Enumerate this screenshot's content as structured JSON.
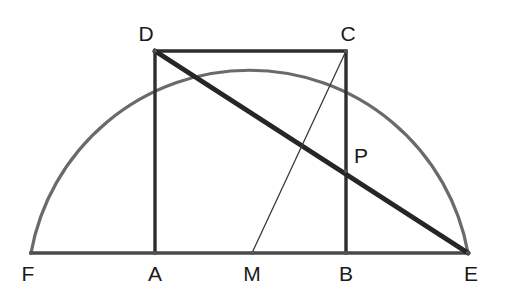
{
  "figure": {
    "width": 509,
    "height": 296,
    "background_color": "#ffffff"
  },
  "colors": {
    "arc": "#6a6a6a",
    "baseline": "#4a4a4a",
    "thin_line": "#3a3a3a",
    "thick_line": "#262626",
    "square_side": "#2e2e2e",
    "label": "#1a1a1a",
    "vertex_dot": "#555555"
  },
  "geometry": {
    "baseline_y": 253,
    "circle": {
      "center_x": 252,
      "center_y": 253,
      "radius": 222
    }
  },
  "points": [
    {
      "id": "F",
      "label": "F",
      "x": 31,
      "y": 253,
      "label_x": 28,
      "label_y": 281,
      "label_anchor": "middle",
      "role": "semicircle-left-end"
    },
    {
      "id": "A",
      "label": "A",
      "x": 155,
      "y": 253,
      "label_x": 155,
      "label_y": 281,
      "label_anchor": "middle",
      "role": "rectangle-bottom-left"
    },
    {
      "id": "M",
      "label": "M",
      "x": 252,
      "y": 253,
      "label_x": 252,
      "label_y": 281,
      "label_anchor": "middle",
      "role": "circle-center"
    },
    {
      "id": "B",
      "label": "B",
      "x": 346,
      "y": 253,
      "label_x": 346,
      "label_y": 281,
      "label_anchor": "middle",
      "role": "rectangle-bottom-right"
    },
    {
      "id": "E",
      "label": "E",
      "x": 468,
      "y": 253,
      "label_x": 471,
      "label_y": 281,
      "label_anchor": "middle",
      "role": "semicircle-right-end"
    },
    {
      "id": "D",
      "label": "D",
      "x": 155,
      "y": 51,
      "label_x": 146,
      "label_y": 41,
      "label_anchor": "middle",
      "role": "rectangle-top-left"
    },
    {
      "id": "C",
      "label": "C",
      "x": 346,
      "y": 51,
      "label_x": 348,
      "label_y": 41,
      "label_anchor": "middle",
      "role": "rectangle-top-right"
    },
    {
      "id": "P",
      "label": "P",
      "x": 346,
      "y": 171,
      "label_x": 354,
      "label_y": 163,
      "label_anchor": "start",
      "role": "intersection-DE-with-CB"
    }
  ],
  "segments": [
    {
      "id": "arc-FE",
      "name": "semicircle-arc",
      "kind": "arc",
      "from": "F",
      "to": "E",
      "stroke": "#6a6a6a",
      "width": 3.2
    },
    {
      "id": "seg-FE",
      "name": "baseline-diameter",
      "kind": "line",
      "from": "F",
      "to": "E",
      "stroke": "#4a4a4a",
      "width": 3.4
    },
    {
      "id": "seg-AD",
      "name": "rectangle-left-side",
      "kind": "line",
      "from": "A",
      "to": "D",
      "stroke": "#2e2e2e",
      "width": 3.4
    },
    {
      "id": "seg-DC",
      "name": "rectangle-top-side",
      "kind": "line",
      "from": "D",
      "to": "C",
      "stroke": "#2e2e2e",
      "width": 3.4
    },
    {
      "id": "seg-CB",
      "name": "rectangle-right-side",
      "kind": "line",
      "from": "C",
      "to": "B",
      "stroke": "#2e2e2e",
      "width": 3.4
    },
    {
      "id": "seg-DE",
      "name": "thick-diagonal-D-to-E",
      "kind": "line",
      "from": "D",
      "to": "E",
      "stroke": "#262626",
      "width": 5.0
    },
    {
      "id": "seg-MC",
      "name": "thin-line-M-to-C",
      "kind": "line",
      "from": "M",
      "to": "C",
      "stroke": "#3a3a3a",
      "width": 1.3
    }
  ]
}
